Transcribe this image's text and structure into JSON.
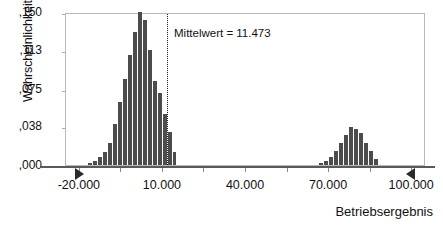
{
  "chart_data": {
    "type": "bar",
    "title": "",
    "subtitle": "",
    "xlabel": "Betriebsergebnis",
    "ylabel": "Wahrscheinlichkeit",
    "xlim": [
      -25000,
      105000
    ],
    "ylim": [
      0.0,
      0.15
    ],
    "grid": false,
    "legend": null,
    "x_tick_labels": [
      "-20.000",
      "10.000",
      "40.000",
      "70.000",
      "100.000"
    ],
    "x_tick_values": [
      -20000,
      10000,
      40000,
      70000,
      100000
    ],
    "y_tick_labels": [
      ",150",
      ",113",
      ",075",
      ",038",
      ",000"
    ],
    "y_tick_values": [
      0.15,
      0.113,
      0.075,
      0.038,
      0.0
    ],
    "bin_width": 1800,
    "annotations": [
      {
        "name": "mean-line",
        "label": "Mittelwert = 11.473",
        "value": 11473,
        "style": "dotted-vertical-line"
      }
    ],
    "markers": [
      {
        "name": "range-marker-left",
        "value": -20000,
        "shape": "triangle-right"
      },
      {
        "name": "range-marker-right",
        "value": 100000,
        "shape": "triangle-left"
      }
    ],
    "bar_color": "#4c4c4c",
    "frame_color": "#b9b9b9",
    "axis_color": "#5a5a5a",
    "series": [
      {
        "name": "Betriebsergebnis-Verteilung",
        "x": [
          -16400,
          -14600,
          -12800,
          -11000,
          -9200,
          -7400,
          -5600,
          -3800,
          -2000,
          -200,
          1600,
          3400,
          5200,
          7000,
          8800,
          10600,
          12400,
          14200,
          67000,
          68800,
          70600,
          72400,
          74200,
          76000,
          77800,
          79600,
          81400,
          83200,
          85000,
          86800
        ],
        "values": [
          0.002,
          0.004,
          0.008,
          0.013,
          0.022,
          0.04,
          0.062,
          0.084,
          0.108,
          0.13,
          0.15,
          0.142,
          0.113,
          0.082,
          0.071,
          0.05,
          0.032,
          0.013,
          0.002,
          0.004,
          0.008,
          0.014,
          0.022,
          0.029,
          0.037,
          0.035,
          0.031,
          0.022,
          0.014,
          0.006
        ]
      }
    ]
  }
}
